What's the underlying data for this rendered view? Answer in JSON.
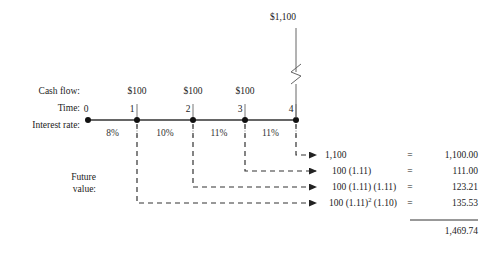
{
  "diagram": {
    "title_cashflow_row": "Cash flow:",
    "title_time_row": "Time:",
    "title_rate_row": "Interest rate:",
    "future_value_label_line1": "Future",
    "future_value_label_line2": "value:",
    "terminal_cashflow": "$1,100",
    "cash_flows": [
      "$100",
      "$100",
      "$100"
    ],
    "time_points": [
      "0",
      "1",
      "2",
      "3",
      "4"
    ],
    "interest_rates": [
      "8%",
      "10%",
      "11%",
      "11%"
    ],
    "rows": [
      {
        "formula": "1,100",
        "equals": "=",
        "amount": "1,100.00"
      },
      {
        "formula": "100 (1.11)",
        "equals": "=",
        "amount": "111.00"
      },
      {
        "formula": "100 (1.11) (1.11)",
        "equals": "=",
        "amount": "123.21"
      },
      {
        "formula_pre": "100 (1.11)",
        "formula_sup": "2",
        "formula_post": " (1.10)",
        "equals": "=",
        "amount": "135.53"
      }
    ],
    "total": "1,469.74",
    "colors": {
      "line": "#555555",
      "dashed": "#444444",
      "text": "#222222",
      "node": "#111111"
    }
  }
}
